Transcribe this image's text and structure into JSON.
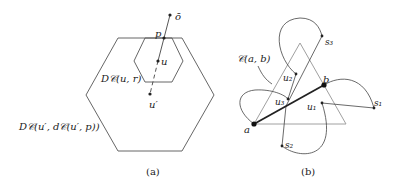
{
  "figure_a": {
    "caption": "(a)",
    "labels": {
      "o_bar": "ō",
      "p": "p",
      "u": "u",
      "u_prime": "u′",
      "small_disk": "D𝒞(u, r)",
      "big_disk": "D𝒞(u′, d𝒞(u′, p))"
    }
  },
  "figure_b": {
    "caption": "(b)",
    "labels": {
      "curve": "𝒞(a, b)",
      "a": "a",
      "b": "b",
      "u1": "u₁",
      "u2": "u₂",
      "u3": "u₃",
      "s1": "s₁",
      "s2": "s₂",
      "s3": "s₃"
    }
  },
  "colors": {
    "stroke": "#444444",
    "triangle": "#a0a0a0",
    "text": "#222222"
  }
}
